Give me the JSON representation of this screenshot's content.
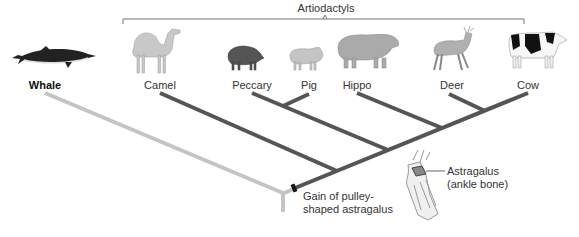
{
  "title": "Artiodactyls",
  "taxa": [
    {
      "name": "Whale",
      "x": 45,
      "bold": true,
      "icon": "whale-icon"
    },
    {
      "name": "Camel",
      "x": 160,
      "bold": false,
      "icon": "camel-icon"
    },
    {
      "name": "Peccary",
      "x": 252,
      "bold": false,
      "icon": "peccary-icon"
    },
    {
      "name": "Pig",
      "x": 308,
      "bold": false,
      "icon": "pig-icon"
    },
    {
      "name": "Hippo",
      "x": 357,
      "bold": false,
      "icon": "hippo-icon"
    },
    {
      "name": "Deer",
      "x": 450,
      "bold": false,
      "icon": "deer-icon"
    },
    {
      "name": "Cow",
      "x": 528,
      "bold": false,
      "icon": "cow-icon"
    }
  ],
  "annotations": {
    "gain_line1": "Gain of pulley-",
    "gain_line2": "shaped astragalus",
    "astragalus_line1": "Astragalus",
    "astragalus_line2": "(ankle bone)"
  },
  "colors": {
    "outgroup_branch": "#c4c4c4",
    "ingroup_branch": "#555555",
    "bracket": "#777777",
    "trait_marker": "#111111"
  }
}
